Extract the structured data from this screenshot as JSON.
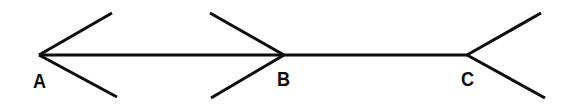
{
  "figure": {
    "name": "Muller-Lyer illusion figure",
    "type": "line-diagram",
    "background_color": "#ffffff",
    "stroke_color": "#0d0d0d",
    "stroke_width": 3.1,
    "canvas": {
      "width": 575,
      "height": 104
    },
    "baseline_y": 55,
    "vertices": [
      {
        "id": "A",
        "label": "A",
        "x": 39,
        "y": 55,
        "fin_direction": "outward",
        "label_x": 33,
        "label_y": 70
      },
      {
        "id": "B",
        "label": "B",
        "x": 284,
        "y": 55,
        "fin_direction": "inward",
        "label_x": 277,
        "label_y": 68
      },
      {
        "id": "C",
        "label": "C",
        "x": 467,
        "y": 55,
        "fin_direction": "outward",
        "label_x": 461,
        "label_y": 68
      }
    ],
    "segments": [
      {
        "id": "baseline-A-B",
        "x1": 39,
        "y1": 55,
        "x2": 284,
        "y2": 55
      },
      {
        "id": "baseline-B-C",
        "x1": 284,
        "y1": 55,
        "x2": 467,
        "y2": 55
      },
      {
        "id": "fin-A-upper",
        "x1": 39,
        "y1": 55,
        "x2": 112,
        "y2": 13
      },
      {
        "id": "fin-A-lower",
        "x1": 39,
        "y1": 55,
        "x2": 117,
        "y2": 97
      },
      {
        "id": "fin-B-upper",
        "x1": 284,
        "y1": 55,
        "x2": 210,
        "y2": 13
      },
      {
        "id": "fin-B-lower",
        "x1": 284,
        "y1": 55,
        "x2": 211,
        "y2": 98
      },
      {
        "id": "fin-C-upper",
        "x1": 467,
        "y1": 55,
        "x2": 541,
        "y2": 13
      },
      {
        "id": "fin-C-lower",
        "x1": 467,
        "y1": 55,
        "x2": 545,
        "y2": 98
      }
    ]
  }
}
